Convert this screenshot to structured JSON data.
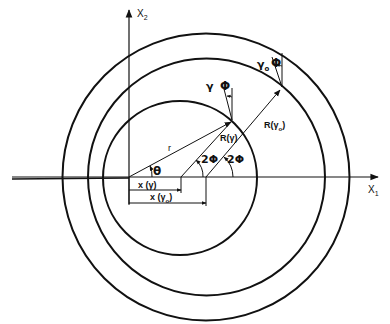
{
  "figure": {
    "type": "geometric-diagram",
    "background": "#ffffff",
    "ink": "#111111",
    "axes": {
      "x_label": "X",
      "x_sub": "1",
      "y_label": "X",
      "y_sub": "2"
    },
    "circles": [
      {
        "name": "inner-circle",
        "cx": 180,
        "cy": 177,
        "r": 78
      },
      {
        "name": "middle-circle",
        "cx": 206,
        "cy": 177,
        "r": 118
      },
      {
        "name": "outer-circle",
        "cx": 206,
        "cy": 177,
        "r": 143
      }
    ],
    "labels": {
      "r": "r",
      "theta": "θ",
      "gamma": "γ",
      "gamma0": "γ",
      "gamma0_sub": "o",
      "phi": "Φ",
      "two_phi_1": "2Φ",
      "two_phi_2": "2Φ",
      "R_gamma": "R(γ)",
      "R_gamma0_prefix": "R(",
      "R_gamma0_sym": "γ",
      "R_gamma0_sub": "o",
      "R_gamma0_suffix": ")",
      "x_gamma": "x (γ)",
      "x_gamma0_prefix": "x (",
      "x_gamma0_sym": "γ",
      "x_gamma0_sub": "o",
      "x_gamma0_suffix": ")"
    }
  }
}
